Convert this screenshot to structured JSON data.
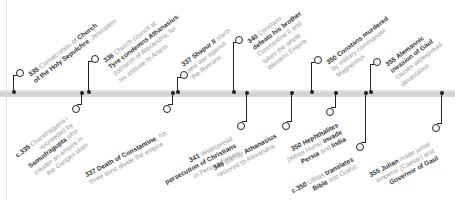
{
  "timeline": {
    "bar_color": "#d6d6d6",
    "line_color": "#222222",
    "events_above": [
      {
        "year": "335",
        "lines": [
          {
            "t": "Consecration of ",
            "b": "Church"
          },
          {
            "b": "of the Holy Sepulchre",
            "t": ", Jerusalem"
          }
        ]
      },
      {
        "year": "336",
        "lines": [
          {
            "t": "Church council at"
          },
          {
            "b": "Tyre condemns Athanasius",
            "t": ","
          },
          {
            "t": "patriarch of Alexandria, for"
          },
          {
            "t": "his attitude to Arians"
          }
        ]
      },
      {
        "year": "337",
        "lines": [
          {
            "b": "Shapur II",
            "t": " starts"
          },
          {
            "t": "new war against"
          },
          {
            "t": "the Romans"
          }
        ]
      },
      {
        "year": "340",
        "lines": [
          {
            "t": "Constans"
          },
          {
            "b": "defeats his brother"
          },
          {
            "t": "Constantine II and"
          },
          {
            "t": "takes the whole"
          },
          {
            "t": "Western Empire"
          }
        ]
      },
      {
        "year": "350",
        "lines": [
          {
            "b": "Constans murdered"
          },
          {
            "t": "by military commander"
          },
          {
            "t": "Magnentius"
          }
        ]
      },
      {
        "year": "355",
        "lines": [
          {
            "b": "Alemannic"
          },
          {
            "b": "invasion of Gaul"
          },
          {
            "t": "causes widespread"
          },
          {
            "t": "devastation"
          }
        ]
      }
    ],
    "events_below": [
      {
        "year": "c.335",
        "lines": [
          {
            "t": "Chandragupta I"
          },
          {
            "t": "succeeded by"
          },
          {
            "b": "Samudragupta",
            "t": " who"
          },
          {
            "t": "creates an empire in"
          },
          {
            "t": "the Ganges plain"
          }
        ]
      },
      {
        "year": "337",
        "lines": [
          {
            "b": "Death of Constantine",
            "t": ", his"
          },
          {
            "t": "three sons divide the empire"
          }
        ]
      },
      {
        "year": "341",
        "lines": [
          {
            "t": "Widespread"
          },
          {
            "b": "persecution of Christians"
          },
          {
            "t": "in Persian Empire"
          }
        ]
      },
      {
        "year": "346",
        "lines": [
          {
            "t": "Bishop ",
            "b": "Athanasius"
          },
          {
            "t": "restored to Alexandria"
          }
        ]
      },
      {
        "year": "350",
        "lines": [
          {
            "b": "Hephthalites"
          },
          {
            "t": "(White Huns) ",
            "b": "invade"
          },
          {
            "b": "Persia",
            "t": " and ",
            "b2": "India"
          }
        ]
      },
      {
        "year": "c.350",
        "lines": [
          {
            "t": "Ulfilas ",
            "b": "translates"
          },
          {
            "b": "Bible",
            "t": " into Gothic"
          }
        ]
      },
      {
        "year": "355",
        "lines": [
          {
            "b": "Julian",
            "t": " made junior"
          },
          {
            "t": "emperor (Caesar) and"
          },
          {
            "b": "Governor of Gaul"
          }
        ]
      }
    ]
  }
}
